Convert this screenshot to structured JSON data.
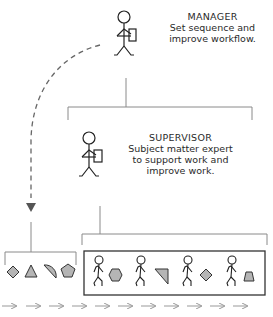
{
  "manager": {
    "title": "MANAGER",
    "description_lines": [
      "Set sequence and",
      "improve workflow."
    ]
  },
  "supervisor": {
    "title": "SUPERVISOR",
    "description_lines": [
      "Subject matter expert",
      "to support work and",
      "improve work."
    ]
  },
  "left_group": {
    "shapes": [
      "diamond",
      "triangle",
      "half-circle",
      "pentagon"
    ]
  },
  "worker_group": {
    "workers": [
      {
        "figure": "stick-figure",
        "shape": "hexagon"
      },
      {
        "figure": "stick-figure",
        "shape": "right-triangle"
      },
      {
        "figure": "stick-figure",
        "shape": "diamond"
      },
      {
        "figure": "stick-figure",
        "shape": "trapezoid"
      }
    ]
  },
  "flow_arrows": {
    "count": 11,
    "direction": "right"
  },
  "colors": {
    "line": "#8a8a8a",
    "shape_fill": "#b5b5b5",
    "shape_stroke": "#333333",
    "box_stroke": "#333333",
    "dashed_arrow": "#666666"
  }
}
